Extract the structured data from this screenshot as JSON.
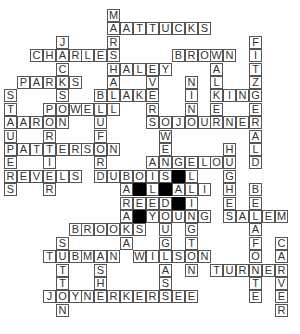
{
  "puzzle": {
    "type": "crossword",
    "grid_origin": {
      "x": 4,
      "y": 9
    },
    "cell_size": {
      "w": 12.9,
      "h": 13.4
    },
    "colors": {
      "cell_bg": "#ffffff",
      "border": "#555555",
      "letter": "#333333",
      "block": "#000000"
    },
    "across": [
      {
        "word": "MATTUCKS",
        "row": 1,
        "col": 8
      },
      {
        "word": "CHARLES",
        "row": 3,
        "col": 2
      },
      {
        "word": "BROWN",
        "row": 3,
        "col": 13
      },
      {
        "word": "HALEY",
        "row": 4,
        "col": 8
      },
      {
        "word": "PARKS",
        "row": 5,
        "col": 1
      },
      {
        "word": "BLAKE",
        "row": 6,
        "col": 7
      },
      {
        "word": "KING",
        "row": 6,
        "col": 16
      },
      {
        "word": "POWELL",
        "row": 7,
        "col": 3
      },
      {
        "word": "AARON",
        "row": 8,
        "col": 0
      },
      {
        "word": "SOJOURNER",
        "row": 8,
        "col": 11
      },
      {
        "word": "PATTERSON",
        "row": 10,
        "col": 0
      },
      {
        "word": "ANGELOU",
        "row": 11,
        "col": 11
      },
      {
        "word": "REVELS",
        "row": 12,
        "col": 0
      },
      {
        "word": "DUBOIS",
        "row": 12,
        "col": 7
      },
      {
        "word": "ALI",
        "row": 13,
        "col": 13
      },
      {
        "word": "REED",
        "row": 14,
        "col": 9
      },
      {
        "word": "YOUNG",
        "row": 15,
        "col": 11
      },
      {
        "word": "SALEM",
        "row": 15,
        "col": 17
      },
      {
        "word": "BROOKS",
        "row": 16,
        "col": 5
      },
      {
        "word": "TUBMAN",
        "row": 18,
        "col": 3
      },
      {
        "word": "WILSON",
        "row": 18,
        "col": 10
      },
      {
        "word": "TURNER",
        "row": 19,
        "col": 16
      },
      {
        "word": "JOYNERKERSEE",
        "row": 21,
        "col": 3
      }
    ],
    "down": [
      {
        "word": "MARSHALL",
        "row": 0,
        "col": 8
      },
      {
        "word": "JACKSON",
        "row": 2,
        "col": 4
      },
      {
        "word": "FITZGERALD",
        "row": 2,
        "col": 19
      },
      {
        "word": "WALKER",
        "row": 3,
        "col": 16
      },
      {
        "word": "EVERS",
        "row": 4,
        "col": 11
      },
      {
        "word": "NINO",
        "row": 5,
        "col": 14
      },
      {
        "word": "STAUPERS",
        "row": 6,
        "col": 0
      },
      {
        "word": "BLUFORD",
        "row": 6,
        "col": 7
      },
      {
        "word": "PORTIER",
        "row": 7,
        "col": 3
      },
      {
        "word": "OWENS",
        "row": 8,
        "col": 12
      },
      {
        "word": "HUGHES",
        "row": 10,
        "col": 17
      },
      {
        "word": "AILEY",
        "row": 11,
        "col": 11
      },
      {
        "word": "ELLINGTON",
        "row": 11,
        "col": 14
      },
      {
        "word": "BARAKA",
        "row": 12,
        "col": 9
      },
      {
        "word": "BELAFONTE",
        "row": 13,
        "col": 19
      },
      {
        "word": "DOUGLASS",
        "row": 14,
        "col": 12
      },
      {
        "word": "CARVER",
        "row": 17,
        "col": 21
      },
      {
        "word": "SUTTON",
        "row": 17,
        "col": 4
      },
      {
        "word": "ASHE",
        "row": 18,
        "col": 7
      }
    ],
    "blocks": [
      {
        "row": 12,
        "col": 13
      },
      {
        "row": 13,
        "col": 10
      },
      {
        "row": 13,
        "col": 12
      },
      {
        "row": 14,
        "col": 13
      },
      {
        "row": 15,
        "col": 10
      }
    ],
    "extra_cells": [
      {
        "letter": "A",
        "row": 13,
        "col": 9
      },
      {
        "letter": "L",
        "row": 13,
        "col": 11
      }
    ]
  }
}
